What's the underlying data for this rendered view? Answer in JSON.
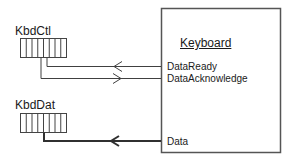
{
  "diagram": {
    "registers": [
      {
        "name": "KbdCtl",
        "bits": 8
      },
      {
        "name": "KbdDat",
        "bits": 8
      }
    ],
    "device": {
      "title": "Keyboard",
      "signals": [
        {
          "label": "DataReady",
          "direction": "to-register",
          "register": "KbdCtl"
        },
        {
          "label": "DataAcknowledge",
          "direction": "to-device",
          "register": "KbdCtl"
        },
        {
          "label": "Data",
          "direction": "to-register",
          "register": "KbdDat",
          "bus": true
        }
      ]
    },
    "colors": {
      "line": "#404040",
      "box_border": "#555555",
      "register_border": "#444444",
      "background": "#ffffff"
    }
  }
}
